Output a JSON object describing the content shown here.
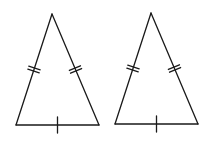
{
  "diagram": {
    "stroke_color": "#1a1a1a",
    "background": "#ffffff",
    "triangles": [
      {
        "id": "left",
        "apex": [
          52,
          14
        ],
        "base_left": [
          16,
          125
        ],
        "base_right": [
          99,
          125
        ],
        "leg_marks": "double",
        "base_marks": "single"
      },
      {
        "id": "right",
        "apex": [
          151,
          13
        ],
        "base_left": [
          115,
          124
        ],
        "base_right": [
          198,
          124
        ],
        "leg_marks": "double",
        "base_marks": "single"
      }
    ]
  }
}
